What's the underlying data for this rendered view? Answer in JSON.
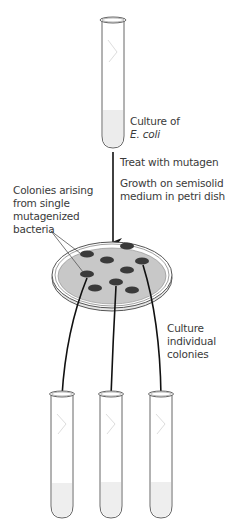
{
  "title_fragment": "",
  "labels": {
    "source_culture": [
      "Culture of",
      "E. coli"
    ],
    "step_mutagen": "Treat with mutagen",
    "step_growth": [
      "Growth on semisolid",
      "medium in petri dish"
    ],
    "colonies_note": [
      "Colonies arising",
      "from single",
      "mutagenized",
      "bacteria"
    ],
    "step_culture": [
      "Culture",
      "individual",
      "colonies"
    ]
  },
  "colors": {
    "outline": "#555555",
    "agar": "#c8c8c8",
    "colony": "#3a3a3a",
    "liquid": "#eeeeee",
    "arrow": "#111111"
  },
  "structure": {
    "source_tube_count": 1,
    "colony_count": 9,
    "cultured_tube_count": 3
  }
}
